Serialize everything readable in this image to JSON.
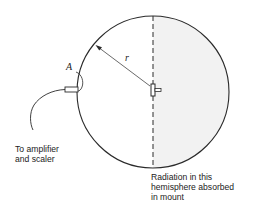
{
  "diagram": {
    "type": "detector-geometry",
    "labels": {
      "point_a": "A",
      "radius": "r",
      "amplifier": [
        "To amplifier",
        "and scaler"
      ],
      "hemisphere": [
        "Radiation in this",
        "hemisphere absorbed",
        "in mount"
      ]
    },
    "shapes": {
      "circle": {
        "cx": 153,
        "cy": 92,
        "r": 76
      },
      "divider": {
        "style": "dashed",
        "x": 153
      },
      "shaded_half": "right",
      "detector": {
        "position": "left",
        "label": "A"
      },
      "source": {
        "position": "center"
      }
    },
    "colors": {
      "stroke": "#2a2a2a",
      "shade": "#f2f2f2",
      "text": "#222222"
    }
  }
}
